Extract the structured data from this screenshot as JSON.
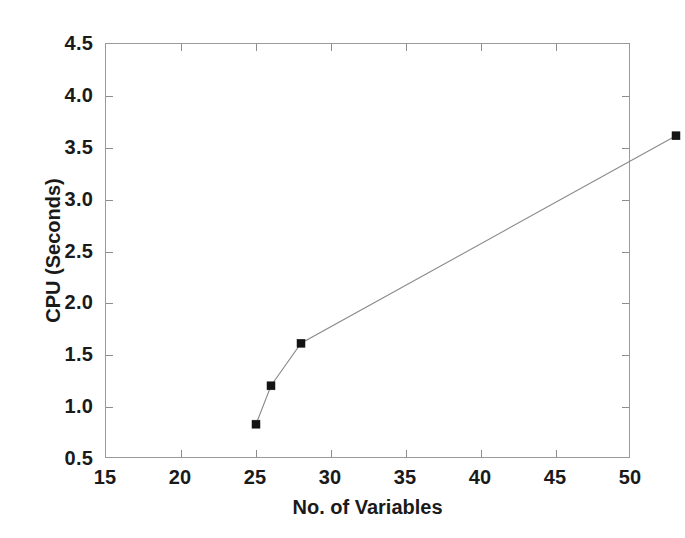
{
  "chart_data": {
    "type": "line",
    "title": "",
    "subtitle": "",
    "xlabel": "No. of Variables",
    "ylabel": "CPU (Seconds)",
    "xlim": [
      15,
      50
    ],
    "ylim": [
      0.5,
      4.5
    ],
    "xticks": [
      15,
      20,
      25,
      30,
      35,
      40,
      45,
      50
    ],
    "xtick_labels": [
      "15",
      "20",
      "25",
      "30",
      "35",
      "40",
      "45",
      "50"
    ],
    "yticks": [
      0.5,
      1.0,
      1.5,
      2.0,
      2.5,
      3.0,
      3.5,
      4.0,
      4.5
    ],
    "ytick_labels": [
      "0.5",
      "1.0",
      "1.5",
      "2.0",
      "2.5",
      "3.0",
      "3.5",
      "4.0",
      "4.5"
    ],
    "grid": false,
    "legend": null,
    "legend_position": "none",
    "annotations": [],
    "marker": "square",
    "line_color": "#8a8a8a",
    "marker_color": "#141414",
    "frame_color": "#9a9a9a",
    "background_color": "#ffffff",
    "series": [
      {
        "name": "CPU time",
        "x": [
          18,
          19,
          21,
          46
        ],
        "values": [
          1.25,
          1.62,
          2.03,
          4.03
        ]
      }
    ]
  }
}
